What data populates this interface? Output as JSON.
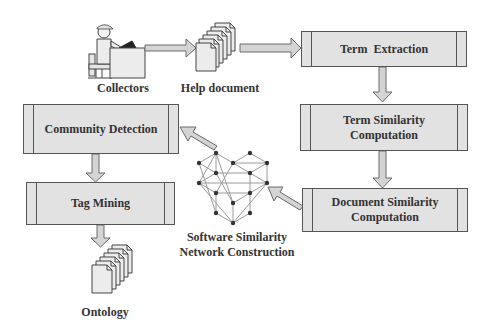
{
  "diagram": {
    "nodes": {
      "collectors": {
        "label": "Collectors"
      },
      "help_document": {
        "label": "Help document"
      },
      "term_extraction": {
        "label": "Term  Extraction"
      },
      "term_similarity": {
        "line1": "Term Similarity",
        "line2": "Computation"
      },
      "document_similarity": {
        "line1": "Document Similarity",
        "line2": "Computation"
      },
      "network": {
        "line1": "Software Similarity",
        "line2": "Network Construction"
      },
      "community_detection": {
        "label": "Community Detection"
      },
      "tag_mining": {
        "label": "Tag Mining"
      },
      "ontology": {
        "label": "Ontology"
      }
    },
    "flow": [
      "Collectors -> Help document",
      "Help document -> Term Extraction",
      "Term Extraction -> Term Similarity Computation",
      "Term Similarity Computation -> Document Similarity Computation",
      "Document Similarity Computation -> Software Similarity Network Construction",
      "Software Similarity Network Construction -> Community Detection",
      "Community Detection -> Tag Mining",
      "Tag Mining -> Ontology"
    ],
    "colors": {
      "box_fill": "#e2e2e2",
      "box_border": "#555555",
      "arrow_fill": "#d4d4d4",
      "arrow_border": "#6a6a6a",
      "node_fill": "#333333",
      "edge": "#999999"
    }
  }
}
